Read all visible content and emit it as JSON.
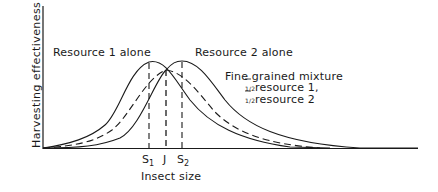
{
  "diagram": {
    "y_axis_label": "Harvesting effectiveness",
    "x_axis_label": "Insect size",
    "curves": [
      {
        "name": "resource-1-alone",
        "label": "Resource 1 alone",
        "style": "solid",
        "peak_x": 149
      },
      {
        "name": "resource-2-alone",
        "label": "Resource 2 alone",
        "style": "solid",
        "peak_x": 182
      },
      {
        "name": "fine-grained-mixture",
        "label": "Fine grained mixture",
        "style": "dashed",
        "peak_x": 166
      }
    ],
    "mixture_label": {
      "title": "Fine grained mixture",
      "line1_fraction": "1/2",
      "line1_text": "resource 1,",
      "line2_fraction": "1/2",
      "line2_text": "resource 2"
    },
    "x_ticks": [
      {
        "label": "S",
        "sub": "1"
      },
      {
        "label": "J",
        "sub": ""
      },
      {
        "label": "S",
        "sub": "2"
      }
    ],
    "colors": {
      "ink": "#1a1a1a",
      "background": "#ffffff"
    }
  }
}
